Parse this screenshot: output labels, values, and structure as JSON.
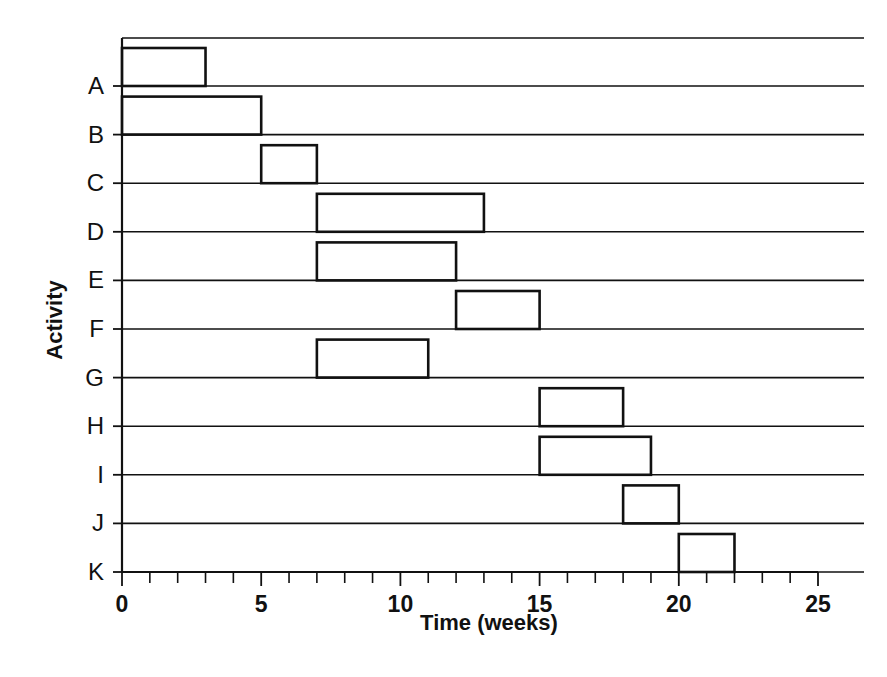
{
  "chart_data": {
    "type": "bar",
    "orientation": "horizontal",
    "title": "",
    "xlabel": "Time (weeks)",
    "ylabel": "Activity",
    "xlim": [
      0,
      25
    ],
    "xticks": [
      0,
      5,
      10,
      15,
      20,
      25
    ],
    "xtick_labels": [
      "0",
      "5",
      "10",
      "15",
      "20",
      "25"
    ],
    "minor_tick_step": 1,
    "grid": false,
    "legend": null,
    "categories": [
      "A",
      "B",
      "C",
      "D",
      "E",
      "F",
      "G",
      "H",
      "I",
      "J",
      "K"
    ],
    "bars": [
      {
        "activity": "A",
        "start": 0,
        "end": 3,
        "duration": 3
      },
      {
        "activity": "B",
        "start": 0,
        "end": 5,
        "duration": 5
      },
      {
        "activity": "C",
        "start": 5,
        "end": 7,
        "duration": 2
      },
      {
        "activity": "D",
        "start": 7,
        "end": 13,
        "duration": 6
      },
      {
        "activity": "E",
        "start": 7,
        "end": 12,
        "duration": 5
      },
      {
        "activity": "F",
        "start": 12,
        "end": 15,
        "duration": 3
      },
      {
        "activity": "G",
        "start": 7,
        "end": 11,
        "duration": 4
      },
      {
        "activity": "H",
        "start": 15,
        "end": 18,
        "duration": 3
      },
      {
        "activity": "I",
        "start": 15,
        "end": 19,
        "duration": 4
      },
      {
        "activity": "J",
        "start": 18,
        "end": 20,
        "duration": 2
      },
      {
        "activity": "K",
        "start": 20,
        "end": 22,
        "duration": 2
      }
    ],
    "colors": {
      "bar_stroke": "#111111",
      "bar_fill": "none",
      "axis": "#111111",
      "background": "#ffffff"
    }
  }
}
